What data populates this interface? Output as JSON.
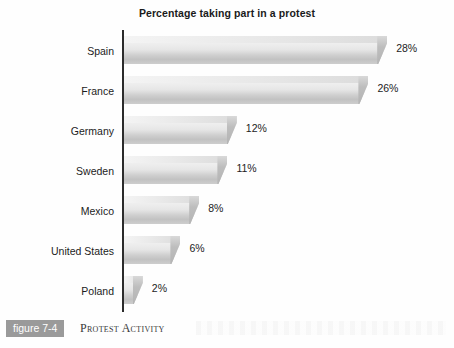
{
  "chart_data": {
    "type": "bar",
    "orientation": "horizontal",
    "title": "Percentage taking part in a protest",
    "xlabel": "",
    "ylabel": "",
    "categories": [
      "Spain",
      "France",
      "Germany",
      "Sweden",
      "Mexico",
      "United States",
      "Poland"
    ],
    "values": [
      28,
      26,
      12,
      11,
      8,
      6,
      2
    ],
    "value_labels": [
      "28%",
      "26%",
      "12%",
      "11%",
      "8%",
      "6%",
      "2%"
    ],
    "xlim": [
      0,
      28
    ],
    "grid": false,
    "legend": null,
    "axis_visible": "y-axis only",
    "bar_style": "3d-shaded-grayscale"
  },
  "caption": {
    "figure_tag": "figure 7-4",
    "caption_text": "Protest Activity"
  },
  "colors": {
    "bar_light": "#f4f4f4",
    "bar_mid": "#cfcfcf",
    "bar_dark": "#b4b4b4",
    "axis": "#2b2b2b",
    "text": "#1c1c1c",
    "tag_background": "#9a9a9a",
    "tag_text": "#ffffff"
  }
}
